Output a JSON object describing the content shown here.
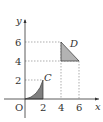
{
  "diagram": {
    "axes": {
      "x_label": "x",
      "y_label": "y",
      "origin_label": "O",
      "x_ticks": [
        "2",
        "4",
        "6"
      ],
      "y_ticks": [
        "2",
        "4",
        "6"
      ]
    },
    "regions": [
      {
        "label": "C",
        "description": "curved region under curve from (0,0) to (2,2), bounded by x=2",
        "color": "#7f7f7f"
      },
      {
        "label": "D",
        "description": "right triangle with vertices (4,6), (4,4), (6,4)",
        "color": "#b3b3b3"
      }
    ],
    "guide_lines": "dashed lines from y-axis at 2, 4, 6 and from x-axis at 4, 6"
  }
}
